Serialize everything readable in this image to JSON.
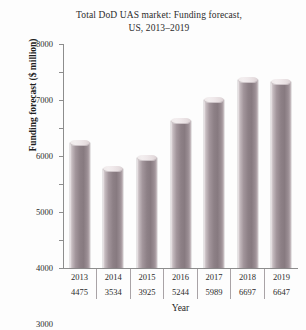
{
  "chart_data": {
    "type": "bar",
    "title": "Total DoD UAS market: Funding forecast, US, 2013–2019",
    "title_line1": "Total DoD UAS market: Funding forecast,",
    "title_line2": "US, 2013–2019",
    "xlabel": "Year",
    "ylabel": "Funding forecast ($ million)",
    "categories": [
      "2013",
      "2014",
      "2015",
      "2016",
      "2017",
      "2018",
      "2019"
    ],
    "values": [
      4475,
      3534,
      3925,
      5244,
      5989,
      6697,
      6647
    ],
    "value_labels": [
      "4475",
      "3534",
      "3925",
      "5244",
      "5989",
      "6697",
      "6647"
    ],
    "ylim": [
      0,
      8000
    ],
    "ytick_step": 1000,
    "yticks": [
      0,
      1000,
      2000,
      3000,
      4000,
      5000,
      6000,
      7000,
      8000
    ],
    "ytick_labels": [
      "0",
      "1000",
      "2000",
      "3000",
      "4000",
      "5000",
      "6000",
      "7000",
      "8000"
    ],
    "grid": false,
    "legend": false,
    "legend_position": "none",
    "bar_color": "#8d8086",
    "bar_highlight_color": "#efe9ea",
    "axis_color": "#8d8d8d",
    "text_color": "#2b2b2b",
    "background_color": "#fdfdfd"
  }
}
